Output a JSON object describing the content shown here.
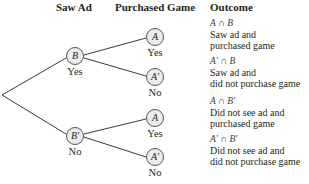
{
  "headers": {
    "saw_ad": "Saw Ad",
    "purchased_game": "Purchased Game",
    "outcome": "Outcome"
  },
  "first_level": [
    {
      "symbol": "B",
      "label": "Yes"
    },
    {
      "symbol": "B'",
      "label": "No"
    }
  ],
  "second_level": [
    {
      "symbol": "A",
      "label": "Yes"
    },
    {
      "symbol": "A'",
      "label": "No"
    },
    {
      "symbol": "A",
      "label": "Yes"
    },
    {
      "symbol": "A'",
      "label": "No"
    }
  ],
  "outcomes": [
    {
      "expr": "A ∩ B",
      "line1": "Saw ad and",
      "line2": "purchased game"
    },
    {
      "expr": "A' ∩ B",
      "line1": "Saw ad and",
      "line2": "did not purchase game"
    },
    {
      "expr": "A ∩ B'",
      "line1": "Did not see ad and",
      "line2": "purchased game"
    },
    {
      "expr": "A' ∩ B'",
      "line1": "Did not see ad and",
      "line2": "did not purchase game"
    }
  ]
}
